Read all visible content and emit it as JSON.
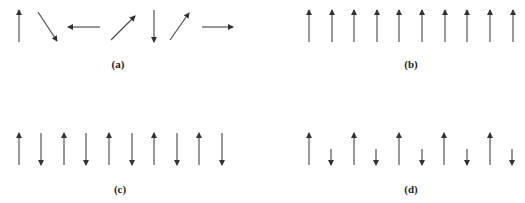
{
  "figure": {
    "panels": [
      {
        "id": "a",
        "label": "(a)",
        "arrows": [
          {
            "x1": 19,
            "y1": 42,
            "x2": 19,
            "y2": 10
          },
          {
            "x1": 38,
            "y1": 12,
            "x2": 57,
            "y2": 41
          },
          {
            "x1": 100,
            "y1": 27,
            "x2": 68,
            "y2": 27
          },
          {
            "x1": 111,
            "y1": 40,
            "x2": 135,
            "y2": 16
          },
          {
            "x1": 154,
            "y1": 10,
            "x2": 154,
            "y2": 42
          },
          {
            "x1": 170,
            "y1": 40,
            "x2": 189,
            "y2": 13
          },
          {
            "x1": 202,
            "y1": 27,
            "x2": 233,
            "y2": 27
          }
        ],
        "label_pos": {
          "x": 118,
          "y": 68
        }
      },
      {
        "id": "b",
        "label": "(b)",
        "arrows": [
          {
            "x1": 309,
            "y1": 42,
            "x2": 309,
            "y2": 10
          },
          {
            "x1": 332,
            "y1": 42,
            "x2": 332,
            "y2": 10
          },
          {
            "x1": 354,
            "y1": 42,
            "x2": 354,
            "y2": 10
          },
          {
            "x1": 377,
            "y1": 42,
            "x2": 377,
            "y2": 10
          },
          {
            "x1": 399,
            "y1": 42,
            "x2": 399,
            "y2": 10
          },
          {
            "x1": 422,
            "y1": 42,
            "x2": 422,
            "y2": 10
          },
          {
            "x1": 445,
            "y1": 42,
            "x2": 445,
            "y2": 10
          },
          {
            "x1": 467,
            "y1": 42,
            "x2": 467,
            "y2": 10
          },
          {
            "x1": 490,
            "y1": 42,
            "x2": 490,
            "y2": 10
          },
          {
            "x1": 513,
            "y1": 42,
            "x2": 513,
            "y2": 10
          }
        ],
        "label_pos": {
          "x": 411,
          "y": 68
        }
      },
      {
        "id": "c",
        "label": "(c)",
        "arrows": [
          {
            "x1": 19,
            "y1": 165,
            "x2": 19,
            "y2": 133
          },
          {
            "x1": 41,
            "y1": 133,
            "x2": 41,
            "y2": 165
          },
          {
            "x1": 64,
            "y1": 165,
            "x2": 64,
            "y2": 133
          },
          {
            "x1": 86,
            "y1": 133,
            "x2": 86,
            "y2": 165
          },
          {
            "x1": 109,
            "y1": 165,
            "x2": 109,
            "y2": 133
          },
          {
            "x1": 132,
            "y1": 133,
            "x2": 132,
            "y2": 165
          },
          {
            "x1": 154,
            "y1": 165,
            "x2": 154,
            "y2": 133
          },
          {
            "x1": 177,
            "y1": 133,
            "x2": 177,
            "y2": 165
          },
          {
            "x1": 199,
            "y1": 165,
            "x2": 199,
            "y2": 133
          },
          {
            "x1": 222,
            "y1": 133,
            "x2": 222,
            "y2": 165
          }
        ],
        "label_pos": {
          "x": 120,
          "y": 193
        }
      },
      {
        "id": "d",
        "label": "(d)",
        "arrows": [
          {
            "x1": 309,
            "y1": 165,
            "x2": 309,
            "y2": 133
          },
          {
            "x1": 331,
            "y1": 149,
            "x2": 331,
            "y2": 165
          },
          {
            "x1": 354,
            "y1": 165,
            "x2": 354,
            "y2": 133
          },
          {
            "x1": 376,
            "y1": 149,
            "x2": 376,
            "y2": 165
          },
          {
            "x1": 399,
            "y1": 165,
            "x2": 399,
            "y2": 133
          },
          {
            "x1": 422,
            "y1": 149,
            "x2": 422,
            "y2": 165
          },
          {
            "x1": 444,
            "y1": 165,
            "x2": 444,
            "y2": 133
          },
          {
            "x1": 467,
            "y1": 149,
            "x2": 467,
            "y2": 165
          },
          {
            "x1": 490,
            "y1": 165,
            "x2": 490,
            "y2": 133
          },
          {
            "x1": 512,
            "y1": 149,
            "x2": 512,
            "y2": 165
          }
        ],
        "label_pos": {
          "x": 411,
          "y": 193
        }
      }
    ]
  },
  "colors": {
    "arrow": "#444444",
    "label": "#222222",
    "background": "#ffffff"
  }
}
